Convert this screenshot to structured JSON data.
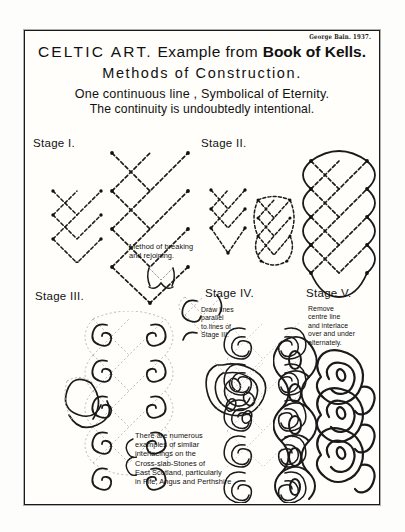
{
  "plate": {
    "signature": "George Bain. 1937.",
    "title_line1_caps": "CELTIC  ART.",
    "title_line1_rest": "Example from ",
    "title_line1_bold": "Book of Kells.",
    "title_line2": "Methods of Construction.",
    "title_line3": "One continuous line , Symbolical of Eternity.",
    "title_line4": "The continuity is undoubtedly intentional."
  },
  "stages": [
    {
      "key": "stage1",
      "label": "Stage I."
    },
    {
      "key": "stage2",
      "label": "Stage II."
    },
    {
      "key": "stage3",
      "label": "Stage III."
    },
    {
      "key": "stage4",
      "label": "Stage IV."
    },
    {
      "key": "stage5",
      "label": "Stage V."
    }
  ],
  "notes": {
    "breaking": "Method of breaking\nand rejoining.",
    "stage4": "Draw lines\nparallel\nto lines of\nStage III.",
    "stage5": "Remove\ncentre line\nand interlace\nover and under\nalternately.",
    "footer": "There are numerous\nexamples of similar\ninterlacings on the\nCross-slab-Stones of\nEast Scotland, particularly\nin Fife, Angus and Perthshire ."
  },
  "colors": {
    "ink": "#1a1a1a",
    "paper": "#fffefb",
    "construction_line": "#9a9a9a",
    "page_background": "#ffffff"
  }
}
